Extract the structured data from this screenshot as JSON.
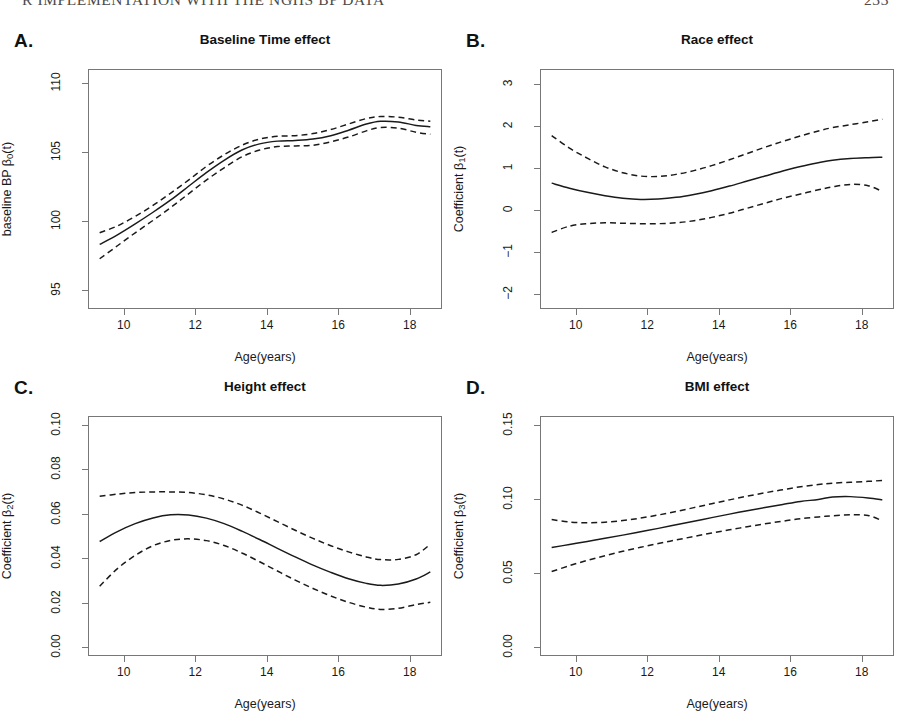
{
  "page": {
    "running_header": "R IMPLEMENTATION WITH THE NGHS BP DATA",
    "page_number": "233"
  },
  "shared": {
    "xlabel": "Age(years)",
    "xticks": [
      10,
      12,
      14,
      16,
      18
    ],
    "xlim": [
      9.0,
      18.9
    ],
    "legend": "none",
    "grid": false,
    "line_style_estimate": "solid",
    "line_style_interval": "dashed"
  },
  "chart_data": [
    {
      "id": "panel-a",
      "letter": "A.",
      "type": "line",
      "title": "Baseline Time effect",
      "xlabel": "Age(years)",
      "ylabel": "baseline BP  β₀(t)",
      "ylabel_main": "baseline BP  β",
      "ylabel_sub": "0",
      "ylabel_tail": "(t)",
      "xlim": [
        9.0,
        18.9
      ],
      "ylim": [
        93.6,
        111.0
      ],
      "xticks": [
        10,
        12,
        14,
        16,
        18
      ],
      "yticks": [
        95,
        100,
        105,
        110
      ],
      "ytick_labels": [
        "95",
        "100",
        "105",
        "110"
      ],
      "x": [
        9.3,
        9.8,
        10.3,
        10.8,
        11.3,
        11.8,
        12.3,
        12.8,
        13.3,
        13.8,
        14.3,
        14.8,
        15.3,
        15.8,
        16.3,
        16.8,
        17.2,
        17.7,
        18.2,
        18.6
      ],
      "series": [
        {
          "name": "estimate",
          "style": "solid",
          "values": [
            98.25,
            98.95,
            99.75,
            100.6,
            101.5,
            102.5,
            103.5,
            104.4,
            105.15,
            105.6,
            105.8,
            105.85,
            105.95,
            106.2,
            106.6,
            107.05,
            107.25,
            107.2,
            106.95,
            106.85
          ]
        },
        {
          "name": "upper_ci",
          "style": "dashed",
          "values": [
            99.1,
            99.6,
            100.3,
            101.1,
            102.0,
            102.95,
            103.95,
            104.8,
            105.5,
            105.95,
            106.15,
            106.2,
            106.35,
            106.65,
            107.05,
            107.45,
            107.6,
            107.55,
            107.35,
            107.25
          ]
        },
        {
          "name": "lower_ci",
          "style": "dashed",
          "values": [
            97.2,
            98.15,
            99.1,
            100.0,
            100.95,
            101.95,
            102.95,
            103.85,
            104.65,
            105.15,
            105.4,
            105.45,
            105.5,
            105.75,
            106.1,
            106.55,
            106.8,
            106.75,
            106.45,
            106.3
          ]
        }
      ]
    },
    {
      "id": "panel-b",
      "letter": "B.",
      "type": "line",
      "title": "Race effect",
      "xlabel": "Age(years)",
      "ylabel": "Coefficient  β₁(t)",
      "ylabel_main": "Coefficient  β",
      "ylabel_sub": "1",
      "ylabel_tail": "(t)",
      "xlim": [
        9.0,
        18.9
      ],
      "ylim": [
        -2.35,
        3.35
      ],
      "xticks": [
        10,
        12,
        14,
        16,
        18
      ],
      "yticks": [
        -2,
        -1,
        0,
        1,
        2,
        3
      ],
      "ytick_labels": [
        "−2",
        "−1",
        "0",
        "1",
        "2",
        "3"
      ],
      "x": [
        9.3,
        9.8,
        10.3,
        10.8,
        11.3,
        11.8,
        12.3,
        12.8,
        13.3,
        13.8,
        14.3,
        14.8,
        15.3,
        15.8,
        16.3,
        16.8,
        17.2,
        17.7,
        18.2,
        18.6
      ],
      "series": [
        {
          "name": "estimate",
          "style": "solid",
          "values": [
            0.64,
            0.52,
            0.42,
            0.34,
            0.28,
            0.25,
            0.26,
            0.3,
            0.37,
            0.46,
            0.57,
            0.69,
            0.81,
            0.93,
            1.04,
            1.13,
            1.19,
            1.23,
            1.25,
            1.26
          ]
        },
        {
          "name": "upper_ci",
          "style": "dashed",
          "values": [
            1.78,
            1.48,
            1.24,
            1.03,
            0.89,
            0.81,
            0.8,
            0.85,
            0.94,
            1.06,
            1.2,
            1.35,
            1.5,
            1.64,
            1.77,
            1.89,
            1.97,
            2.04,
            2.11,
            2.17
          ]
        },
        {
          "name": "lower_ci",
          "style": "dashed",
          "values": [
            -0.54,
            -0.39,
            -0.33,
            -0.31,
            -0.32,
            -0.33,
            -0.33,
            -0.31,
            -0.26,
            -0.18,
            -0.08,
            0.04,
            0.16,
            0.28,
            0.38,
            0.48,
            0.55,
            0.61,
            0.58,
            0.44
          ]
        }
      ]
    },
    {
      "id": "panel-c",
      "letter": "C.",
      "type": "line",
      "title": "Height effect",
      "xlabel": "Age(years)",
      "ylabel": "Coefficient  β₂(t)",
      "ylabel_main": "Coefficient  β",
      "ylabel_sub": "2",
      "ylabel_tail": "(t)",
      "xlim": [
        9.0,
        18.9
      ],
      "ylim": [
        -0.004,
        0.104
      ],
      "xticks": [
        10,
        12,
        14,
        16,
        18
      ],
      "yticks": [
        0.0,
        0.02,
        0.04,
        0.06,
        0.08,
        0.1
      ],
      "ytick_labels": [
        "0.00",
        "0.02",
        "0.04",
        "0.06",
        "0.08",
        "0.10"
      ],
      "x": [
        9.3,
        9.8,
        10.3,
        10.8,
        11.3,
        11.8,
        12.3,
        12.8,
        13.3,
        13.8,
        14.3,
        14.8,
        15.3,
        15.8,
        16.3,
        16.8,
        17.2,
        17.7,
        18.2,
        18.6
      ],
      "series": [
        {
          "name": "estimate",
          "style": "solid",
          "values": [
            0.0475,
            0.052,
            0.0556,
            0.0582,
            0.0596,
            0.0595,
            0.0581,
            0.0556,
            0.0522,
            0.0484,
            0.0444,
            0.0405,
            0.0368,
            0.0335,
            0.0306,
            0.0285,
            0.0276,
            0.0282,
            0.0305,
            0.0337
          ]
        },
        {
          "name": "upper_ci",
          "style": "dashed",
          "values": [
            0.068,
            0.069,
            0.0697,
            0.07,
            0.07,
            0.0697,
            0.0687,
            0.0668,
            0.064,
            0.0604,
            0.0565,
            0.0526,
            0.0489,
            0.0456,
            0.0428,
            0.0405,
            0.0393,
            0.0394,
            0.0415,
            0.0463
          ]
        },
        {
          "name": "lower_ci",
          "style": "dashed",
          "values": [
            0.0272,
            0.0352,
            0.0412,
            0.0456,
            0.048,
            0.0487,
            0.0479,
            0.0457,
            0.0423,
            0.0383,
            0.0341,
            0.03,
            0.0262,
            0.0228,
            0.0199,
            0.0177,
            0.0167,
            0.0172,
            0.0189,
            0.0199
          ]
        }
      ]
    },
    {
      "id": "panel-d",
      "letter": "D.",
      "type": "line",
      "title": "BMI effect",
      "xlabel": "Age(years)",
      "ylabel": "Coefficient  β₃(t)",
      "ylabel_main": "Coefficient  β",
      "ylabel_sub": "3",
      "ylabel_tail": "(t)",
      "xlim": [
        9.0,
        18.9
      ],
      "ylim": [
        -0.006,
        0.156
      ],
      "xticks": [
        10,
        12,
        14,
        16,
        18
      ],
      "yticks": [
        0.0,
        0.05,
        0.1,
        0.15
      ],
      "ytick_labels": [
        "0.00",
        "0.05",
        "0.10",
        "0.15"
      ],
      "x": [
        9.3,
        9.8,
        10.3,
        10.8,
        11.3,
        11.8,
        12.3,
        12.8,
        13.3,
        13.8,
        14.3,
        14.8,
        15.3,
        15.8,
        16.3,
        16.8,
        17.2,
        17.7,
        18.2,
        18.6
      ],
      "series": [
        {
          "name": "estimate",
          "style": "solid",
          "values": [
            0.0672,
            0.0692,
            0.0713,
            0.0734,
            0.0756,
            0.0779,
            0.0802,
            0.0826,
            0.085,
            0.0875,
            0.0899,
            0.0922,
            0.0944,
            0.0965,
            0.0985,
            0.0999,
            0.1015,
            0.1018,
            0.1009,
            0.0996
          ]
        },
        {
          "name": "upper_ci",
          "style": "dashed",
          "values": [
            0.0862,
            0.0845,
            0.084,
            0.0844,
            0.0855,
            0.0872,
            0.0893,
            0.0917,
            0.0943,
            0.097,
            0.0996,
            0.1021,
            0.1044,
            0.1065,
            0.1085,
            0.11,
            0.111,
            0.1116,
            0.1122,
            0.1128
          ]
        },
        {
          "name": "lower_ci",
          "style": "dashed",
          "values": [
            0.0508,
            0.0548,
            0.0584,
            0.0616,
            0.0646,
            0.0673,
            0.0699,
            0.0723,
            0.0747,
            0.077,
            0.0792,
            0.0813,
            0.0833,
            0.0851,
            0.0868,
            0.088,
            0.0888,
            0.0894,
            0.089,
            0.0853
          ]
        }
      ]
    }
  ]
}
